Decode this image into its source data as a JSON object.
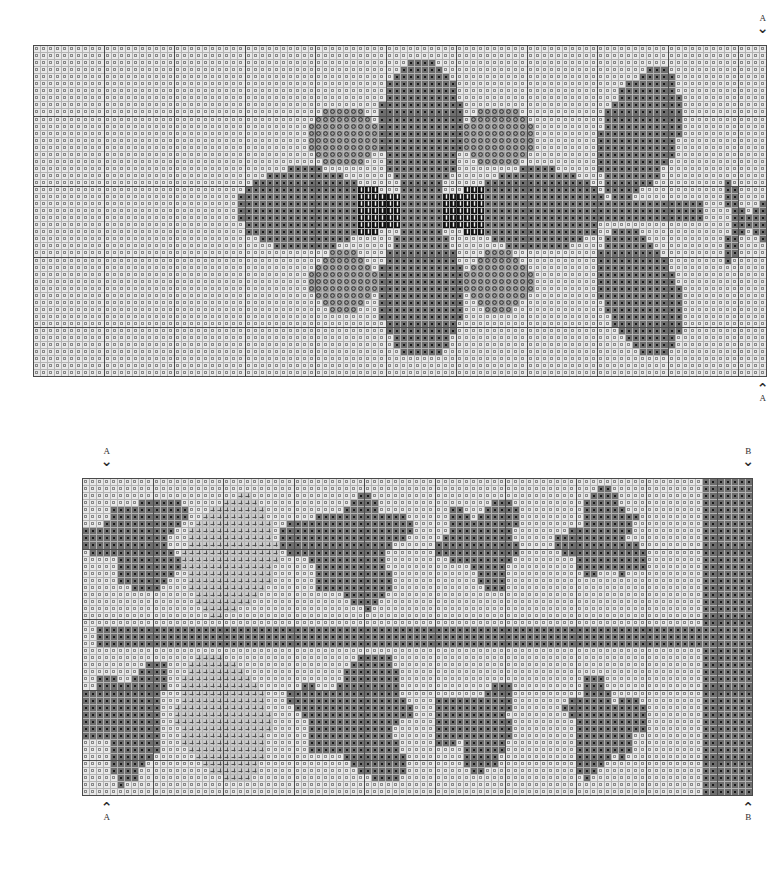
{
  "document": {
    "type": "cross-stitch-pattern-chart",
    "title": "",
    "background_color": "#ffffff",
    "page_width": 780,
    "page_height": 869
  },
  "palette": {
    "blank": "#e8e8e8",
    "light_gray": "#c9c9c9",
    "mid_gray": "#9a9a9a",
    "dark_gray": "#6e6e6e",
    "darker_gray": "#5a5a5a",
    "black": "#141414",
    "grid_thin": "#b4b4b4",
    "grid_thick": "#4a4a4a",
    "symbol_dark": "#4a4a4a",
    "symbol_light": "#f2f2f2"
  },
  "legend_symbols": [
    {
      "key": "blank",
      "name": "tiny-square-symbol",
      "glyph": "□",
      "fill": "#e8e8e8"
    },
    {
      "key": "light_gray",
      "name": "plus-symbol",
      "glyph": "+",
      "fill": "#c9c9c9"
    },
    {
      "key": "mid_gray",
      "name": "circle-symbol",
      "glyph": "o",
      "fill": "#9a9a9a"
    },
    {
      "key": "dark_gray",
      "name": "dot-symbol",
      "glyph": "·",
      "fill": "#6e6e6e"
    },
    {
      "key": "black",
      "name": "vertical-bar-symbol",
      "glyph": "|",
      "fill": "#141414"
    }
  ],
  "charts": [
    {
      "id": "chart-a",
      "name": "upper-pattern-chart",
      "left": 33,
      "top": 45,
      "cell": 7.05,
      "cols": 104,
      "rows": 47,
      "bold_every": 10,
      "markers": {
        "top": [
          {
            "label": "A",
            "direction": "down",
            "col": 103
          }
        ],
        "bottom": [
          {
            "label": "A",
            "direction": "up",
            "col": 103
          }
        ]
      },
      "motif": "flower-with-stem-and-leaves"
    },
    {
      "id": "chart-b",
      "name": "lower-pattern-chart",
      "left": 82,
      "top": 478,
      "cell": 7.05,
      "cols": 95,
      "rows": 45,
      "bold_every": 10,
      "markers": {
        "top": [
          {
            "label": "A",
            "direction": "down",
            "col": 3
          },
          {
            "label": "B",
            "direction": "down",
            "col": 94
          }
        ],
        "bottom": [
          {
            "label": "A",
            "direction": "up",
            "col": 3
          },
          {
            "label": "B",
            "direction": "up",
            "col": 94
          }
        ]
      },
      "motif": "leafy-vine-continuation"
    }
  ],
  "chart_data": {
    "type": "heatmap",
    "xlabel": "",
    "ylabel": "",
    "grid": true,
    "legend_position": "none",
    "note": "Two gridded stitch charts; cell values are palette indices 0=blank,1=light,2=mid,3=dark,4=black",
    "panels": [
      {
        "name": "chart-a",
        "cols": 104,
        "rows": 47,
        "shapes": [
          {
            "kind": "ellipse",
            "color": 3,
            "cx": 55.0,
            "cy": 11.5,
            "rx": 6.0,
            "ry": 9.5,
            "label": "top-petal"
          },
          {
            "kind": "ellipse",
            "color": 3,
            "cx": 55.0,
            "cy": 35.0,
            "rx": 6.0,
            "ry": 9.5,
            "label": "bottom-petal"
          },
          {
            "kind": "ellipse",
            "color": 3,
            "cx": 38.5,
            "cy": 23.3,
            "rx": 9.5,
            "ry": 6.0,
            "label": "left-petal"
          },
          {
            "kind": "ellipse",
            "color": 3,
            "cx": 71.5,
            "cy": 23.3,
            "rx": 9.5,
            "ry": 6.0,
            "label": "right-petal"
          },
          {
            "kind": "ellipse",
            "color": 2,
            "cx": 44.0,
            "cy": 13.0,
            "rx": 5.0,
            "ry": 4.2,
            "label": "upper-left-petal"
          },
          {
            "kind": "ellipse",
            "color": 2,
            "cx": 66.0,
            "cy": 13.0,
            "rx": 5.0,
            "ry": 4.2,
            "label": "upper-right-petal"
          },
          {
            "kind": "ellipse",
            "color": 2,
            "cx": 44.0,
            "cy": 33.5,
            "rx": 5.0,
            "ry": 4.2,
            "label": "lower-left-petal"
          },
          {
            "kind": "ellipse",
            "color": 2,
            "cx": 66.0,
            "cy": 33.5,
            "rx": 5.0,
            "ry": 4.2,
            "label": "lower-right-petal"
          },
          {
            "kind": "rect",
            "color": 4,
            "x0": 46,
            "y0": 20,
            "x1": 49,
            "y1": 27,
            "label": "center-bar-left"
          },
          {
            "kind": "rect",
            "color": 4,
            "x0": 61,
            "y0": 20,
            "x1": 64,
            "y1": 27,
            "label": "center-bar-right"
          },
          {
            "kind": "rect",
            "color": 4,
            "x0": 49,
            "y0": 21,
            "x1": 61,
            "y1": 26,
            "label": "center-core"
          },
          {
            "kind": "rect",
            "color": 3,
            "x0": 52,
            "y0": 16,
            "x1": 58,
            "y1": 31,
            "label": "center-vertical"
          },
          {
            "kind": "rect",
            "color": 3,
            "x0": 74,
            "y0": 22,
            "x1": 95,
            "y1": 25,
            "label": "stem"
          },
          {
            "kind": "leaf",
            "color": 3,
            "cx": 86.0,
            "cy": 12.5,
            "rx": 5.5,
            "ry": 10.0,
            "tilt": 0.35,
            "label": "upper-leaf"
          },
          {
            "kind": "leaf",
            "color": 3,
            "cx": 86.0,
            "cy": 35.0,
            "rx": 5.5,
            "ry": 10.0,
            "tilt": -0.35,
            "label": "lower-leaf"
          },
          {
            "kind": "sprig",
            "color": 3,
            "cx": 101.0,
            "cy": 23.5,
            "label": "right-edge-sprig"
          }
        ]
      },
      {
        "name": "chart-b",
        "cols": 95,
        "rows": 45,
        "shapes": [
          {
            "kind": "rect",
            "color": 3,
            "x0": 2,
            "y0": 21,
            "x1": 93,
            "y1": 24,
            "label": "main-stem"
          },
          {
            "kind": "blob",
            "color": 3,
            "cx": 8.0,
            "cy": 9.0,
            "rx": 6.0,
            "ry": 6.5,
            "label": "top-left-floret"
          },
          {
            "kind": "blob",
            "color": 3,
            "cx": 6.0,
            "cy": 34.0,
            "rx": 6.0,
            "ry": 7.0,
            "label": "bottom-left-floret"
          },
          {
            "kind": "leaf",
            "color": 1,
            "cx": 21.0,
            "cy": 11.0,
            "rx": 6.5,
            "ry": 9.0,
            "tilt": 0.3,
            "label": "upper-light-leaf"
          },
          {
            "kind": "leaf",
            "color": 1,
            "cx": 20.0,
            "cy": 34.0,
            "rx": 6.5,
            "ry": 9.5,
            "tilt": -0.3,
            "label": "lower-light-leaf"
          },
          {
            "kind": "blob",
            "color": 3,
            "cx": 38.0,
            "cy": 10.0,
            "rx": 7.5,
            "ry": 7.0,
            "label": "upper-mid-leaf"
          },
          {
            "kind": "blob",
            "color": 3,
            "cx": 39.0,
            "cy": 34.0,
            "rx": 7.5,
            "ry": 8.0,
            "label": "lower-mid-leaf"
          },
          {
            "kind": "blob",
            "color": 3,
            "cx": 57.0,
            "cy": 9.0,
            "rx": 5.5,
            "ry": 5.5,
            "label": "upper-small-floret"
          },
          {
            "kind": "blob",
            "color": 3,
            "cx": 56.0,
            "cy": 35.0,
            "rx": 5.5,
            "ry": 5.5,
            "label": "lower-small-floret"
          },
          {
            "kind": "blob",
            "color": 3,
            "cx": 74.0,
            "cy": 8.5,
            "rx": 5.0,
            "ry": 6.0,
            "label": "upper-right-floret"
          },
          {
            "kind": "blob",
            "color": 3,
            "cx": 74.0,
            "cy": 35.0,
            "rx": 5.0,
            "ry": 6.0,
            "label": "lower-right-floret"
          },
          {
            "kind": "rect",
            "color": 3,
            "x0": 88,
            "y0": 0,
            "x1": 95,
            "y1": 45,
            "label": "right-edge-mass"
          }
        ]
      }
    ]
  }
}
